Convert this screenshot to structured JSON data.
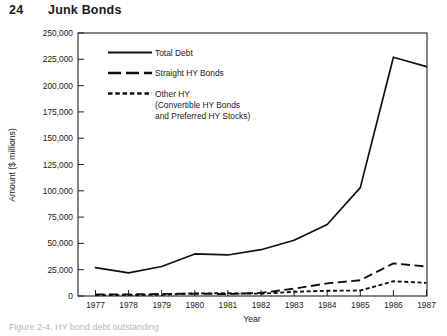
{
  "page": {
    "number": "24",
    "title": "Junk Bonds",
    "caption_partial": "Figure 2-4. HY bond debt outstanding"
  },
  "chart_data": {
    "type": "line",
    "title": "",
    "xlabel": "Year",
    "ylabel": "Amount ($ millions)",
    "x": [
      1977,
      1978,
      1979,
      1980,
      1981,
      1982,
      1983,
      1984,
      1985,
      1986,
      1987
    ],
    "xtick_labels": [
      "1977",
      "1978",
      "1979",
      "1980",
      "1981",
      "1982",
      "1983",
      "1984",
      "1985",
      "1986",
      "1987"
    ],
    "ytick_labels": [
      "0",
      "25,000",
      "50,000",
      "75,000",
      "100,000",
      "125,000",
      "150,000",
      "175,000",
      "200,000",
      "225,000",
      "250,000"
    ],
    "ytick_values": [
      0,
      25000,
      50000,
      75000,
      100000,
      125000,
      150000,
      175000,
      200000,
      225000,
      250000
    ],
    "ylim": [
      0,
      250000
    ],
    "xlim": [
      1977,
      1987
    ],
    "grid": false,
    "legend_position": "upper-left-inside",
    "series": [
      {
        "name": "Total Debt",
        "style": "solid",
        "values": [
          27000,
          22000,
          28000,
          40000,
          39000,
          44000,
          53000,
          68000,
          103000,
          227000,
          218000
        ]
      },
      {
        "name": "Straight HY Bonds",
        "style": "dashed",
        "values": [
          1500,
          1500,
          2000,
          2200,
          1800,
          3000,
          7000,
          12000,
          15000,
          31000,
          28000
        ]
      },
      {
        "name": "Other HY",
        "name_extra_line1": "(Convertible HY Bonds",
        "name_extra_line2": "and Preferred HY Stocks)",
        "style": "dotted",
        "values": [
          800,
          900,
          1200,
          2500,
          2600,
          2200,
          4000,
          5000,
          5200,
          14000,
          12500
        ]
      }
    ]
  }
}
